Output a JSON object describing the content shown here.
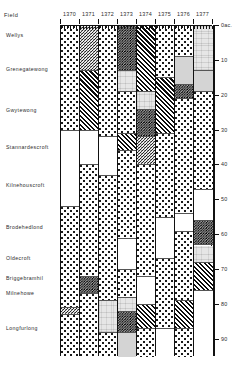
{
  "header": {
    "field_label": "Field",
    "unit_label": "0ac."
  },
  "chart_data": {
    "type": "area",
    "title": "",
    "xlabel": "",
    "ylabel": "acres",
    "grid": false,
    "legend": "none",
    "x": [
      "1370",
      "1371",
      "1372",
      "1373",
      "1374",
      "1375",
      "1376",
      "1377"
    ],
    "ylim": [
      0,
      95
    ],
    "y_ticks": [
      0,
      10,
      20,
      30,
      40,
      50,
      60,
      70,
      80,
      90
    ],
    "y_tick_labels": [
      "0ac.",
      "10",
      "20",
      "30",
      "40",
      "50",
      "60",
      "70",
      "80",
      "90"
    ],
    "categories": [
      {
        "name": "Wellys",
        "acres_start": 0,
        "acres_end": 6
      },
      {
        "name": "Grenegatewong",
        "acres_start": 6,
        "acres_end": 19
      },
      {
        "name": "Gwytewong",
        "acres_start": 19,
        "acres_end": 30
      },
      {
        "name": "Stannardescroft",
        "acres_start": 30,
        "acres_end": 40
      },
      {
        "name": "Kilnehouscroft",
        "acres_start": 40,
        "acres_end": 52
      },
      {
        "name": "Brodehedlond",
        "acres_start": 52,
        "acres_end": 64
      },
      {
        "name": "Oldecroft",
        "acres_start": 64,
        "acres_end": 70
      },
      {
        "name": "Briggebramhil",
        "acres_start": 70,
        "acres_end": 75
      },
      {
        "name": "Milnehowe",
        "acres_start": 75,
        "acres_end": 79
      },
      {
        "name": "Longfurlong",
        "acres_start": 79,
        "acres_end": 95
      }
    ],
    "fill_keys": [
      "dots",
      "hatch",
      "stipple",
      "gray",
      "lightgray",
      "dense",
      "blank"
    ],
    "columns": [
      {
        "year": "1370",
        "cells": [
          {
            "fill": "dots",
            "span": 30
          },
          {
            "fill": "blank",
            "span": 22
          },
          {
            "fill": "dots",
            "span": 29
          },
          {
            "fill": "stipple",
            "span": 2
          },
          {
            "fill": "dots",
            "span": 12
          }
        ]
      },
      {
        "year": "1371",
        "cells": [
          {
            "fill": "stipple",
            "span": 13
          },
          {
            "fill": "hatch",
            "span": 17
          },
          {
            "fill": "blank",
            "span": 10
          },
          {
            "fill": "dots",
            "span": 32
          },
          {
            "fill": "dense",
            "span": 5
          },
          {
            "fill": "dots",
            "span": 18
          }
        ]
      },
      {
        "year": "1372",
        "cells": [
          {
            "fill": "dots",
            "span": 32
          },
          {
            "fill": "blank",
            "span": 11
          },
          {
            "fill": "dots",
            "span": 36
          },
          {
            "fill": "lightgray",
            "span": 9
          },
          {
            "fill": "dots",
            "span": 7
          }
        ]
      },
      {
        "year": "1373",
        "cells": [
          {
            "fill": "dense",
            "span": 13
          },
          {
            "fill": "lightgray",
            "span": 6
          },
          {
            "fill": "dots",
            "span": 12
          },
          {
            "fill": "hatch",
            "span": 5
          },
          {
            "fill": "dots",
            "span": 25
          },
          {
            "fill": "blank",
            "span": 9
          },
          {
            "fill": "dots",
            "span": 8
          },
          {
            "fill": "lightgray",
            "span": 4
          },
          {
            "fill": "dense",
            "span": 6
          },
          {
            "fill": "gray",
            "span": 7
          }
        ]
      },
      {
        "year": "1374",
        "cells": [
          {
            "fill": "hatch",
            "span": 19
          },
          {
            "fill": "lightgray",
            "span": 5
          },
          {
            "fill": "dense",
            "span": 8
          },
          {
            "fill": "stipple",
            "span": 8
          },
          {
            "fill": "dots",
            "span": 32
          },
          {
            "fill": "blank",
            "span": 8
          },
          {
            "fill": "hatch",
            "span": 7
          },
          {
            "fill": "dots",
            "span": 8
          }
        ]
      },
      {
        "year": "1375",
        "cells": [
          {
            "fill": "dots",
            "span": 15
          },
          {
            "fill": "hatch",
            "span": 16
          },
          {
            "fill": "dots",
            "span": 24
          },
          {
            "fill": "blank",
            "span": 12
          },
          {
            "fill": "dots",
            "span": 20
          },
          {
            "fill": "blank",
            "span": 8
          }
        ]
      },
      {
        "year": "1376",
        "cells": [
          {
            "fill": "dots",
            "span": 9
          },
          {
            "fill": "gray",
            "span": 8
          },
          {
            "fill": "dense",
            "span": 4
          },
          {
            "fill": "dots",
            "span": 33
          },
          {
            "fill": "blank",
            "span": 5
          },
          {
            "fill": "dots",
            "span": 20
          },
          {
            "fill": "hatch",
            "span": 8
          },
          {
            "fill": "dots",
            "span": 8
          }
        ]
      },
      {
        "year": "1377",
        "cells": [
          {
            "fill": "lightgray",
            "span": 13
          },
          {
            "fill": "gray",
            "span": 6
          },
          {
            "fill": "dots",
            "span": 28
          },
          {
            "fill": "blank",
            "span": 9
          },
          {
            "fill": "dense",
            "span": 7
          },
          {
            "fill": "lightgray",
            "span": 5
          },
          {
            "fill": "hatch",
            "span": 8
          },
          {
            "fill": "blank",
            "span": 19
          }
        ]
      }
    ]
  }
}
